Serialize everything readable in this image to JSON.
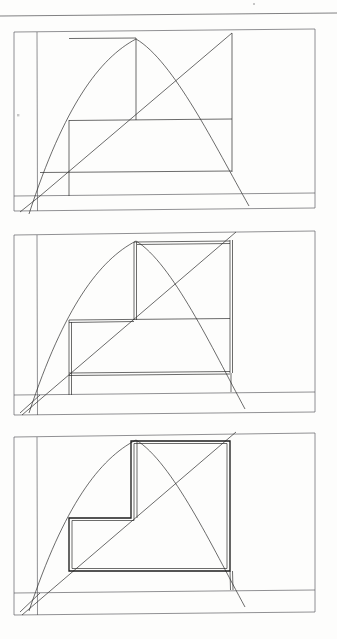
{
  "document": {
    "kind": "scanned-hand-drawn-figure",
    "title": "",
    "page_width": 337,
    "page_height": 639,
    "background_color": "#fdfdfc",
    "ink_color": "#2c2c2c",
    "bold_ink_color": "#1d1d1d",
    "soft_ink_color": "#55555a"
  },
  "header_rule": {
    "name": "top-horizontal-rule",
    "x1": 0,
    "y1": 16,
    "x2": 337,
    "y2": 13
  },
  "marks": [
    {
      "name": "tick-dot-left",
      "x": 17,
      "y": 114,
      "w": 2.4,
      "h": 2.4
    },
    {
      "name": "speck-top-right",
      "x": 253,
      "y": 3,
      "w": 2,
      "h": 2
    }
  ],
  "panels": [
    {
      "name": "panel-1",
      "index": 1,
      "emphasis": "none",
      "frame": {
        "x1": 14,
        "y1": 32,
        "x2": 315,
        "y2": 211,
        "top_right_y": 29,
        "bottom_right_y": 208
      },
      "baseline": {
        "x1": 14,
        "y1": 196,
        "x2": 315,
        "y2": 193
      },
      "axis_left": {
        "x": 37,
        "y1": 32,
        "x2": 37,
        "y2": 211
      },
      "origin": {
        "x": 40,
        "y": 196
      },
      "diagonal": {
        "x1": 40,
        "y1": 196,
        "x2": 232,
        "y2": 33
      },
      "parabola": {
        "x_left": 29,
        "y_left": 214,
        "apex_x": 136,
        "apex_y": 39,
        "x_right": 249,
        "y_right": 206
      },
      "steps": [
        {
          "name": "step-1-outer",
          "x_left": 40,
          "x_right": 232,
          "y_top": 172,
          "y_base": 196
        },
        {
          "name": "step-2-mid",
          "x_left": 69,
          "x_right": 232,
          "y_top": 120,
          "y_base": 172
        },
        {
          "name": "step-3-inner",
          "x_left": 69,
          "x_right": 136,
          "y_top": 38,
          "y_base": 120
        }
      ],
      "risers": [
        {
          "name": "riser-right-tall",
          "x": 232,
          "y1": 33,
          "y2": 172
        },
        {
          "name": "riser-mid",
          "x": 69,
          "y1": 120,
          "y2": 196
        },
        {
          "name": "riser-apex",
          "x": 136,
          "y1": 38,
          "y2": 120
        }
      ]
    },
    {
      "name": "panel-2",
      "index": 2,
      "emphasis": "double-traced",
      "frame": {
        "x1": 14,
        "y1": 235,
        "x2": 315,
        "y2": 415,
        "top_right_y": 231,
        "bottom_right_y": 412
      },
      "baseline": {
        "x1": 14,
        "y1": 395,
        "x2": 315,
        "y2": 392
      },
      "axis_left": {
        "x": 37,
        "y1": 235,
        "x2": 37,
        "y2": 415
      },
      "origin": {
        "x": 40,
        "y": 395
      },
      "diagonal": {
        "x1": 22,
        "y1": 415,
        "x2": 236,
        "y2": 232
      },
      "parabola": {
        "x_left": 29,
        "y_left": 413,
        "apex_x": 136,
        "apex_y": 241,
        "x_right": 245,
        "y_right": 409
      },
      "steps": [
        {
          "name": "step-1-outer",
          "x_left": 69,
          "x_right": 230,
          "y_top": 373,
          "y_base": 395
        },
        {
          "name": "step-2-mid",
          "x_left": 69,
          "x_right": 134,
          "y_top": 320,
          "y_base": 373
        },
        {
          "name": "step-3-inner",
          "x_left": 134,
          "x_right": 230,
          "y_top": 242,
          "y_base": 320
        }
      ],
      "risers": [
        {
          "name": "riser-right-tall",
          "x": 230,
          "y1": 240,
          "y2": 373
        },
        {
          "name": "riser-left",
          "x": 69,
          "y1": 320,
          "y2": 395
        },
        {
          "name": "riser-apex",
          "x": 134,
          "y1": 242,
          "y2": 320
        }
      ]
    },
    {
      "name": "panel-3",
      "index": 3,
      "emphasis": "bold-staircase",
      "frame": {
        "x1": 14,
        "y1": 437,
        "x2": 315,
        "y2": 615,
        "top_right_y": 433,
        "bottom_right_y": 612
      },
      "baseline": {
        "x1": 14,
        "y1": 593,
        "x2": 315,
        "y2": 590
      },
      "axis_left": {
        "x": 37,
        "y1": 437,
        "x2": 37,
        "y2": 615
      },
      "origin": {
        "x": 40,
        "y": 593
      },
      "diagonal": {
        "x1": 22,
        "y1": 615,
        "x2": 236,
        "y2": 432
      },
      "parabola": {
        "x_left": 29,
        "y_left": 611,
        "apex_x": 136,
        "apex_y": 440,
        "x_right": 245,
        "y_right": 607
      },
      "steps": [
        {
          "name": "step-1-outer",
          "x_left": 69,
          "x_right": 230,
          "y_top": 571,
          "y_base": 593
        },
        {
          "name": "step-2-mid",
          "x_left": 69,
          "x_right": 131,
          "y_top": 518,
          "y_base": 571
        },
        {
          "name": "step-3-inner",
          "x_left": 131,
          "x_right": 230,
          "y_top": 441,
          "y_base": 518
        }
      ],
      "risers": [
        {
          "name": "riser-right-tall",
          "x": 230,
          "y1": 440,
          "y2": 571
        },
        {
          "name": "riser-left",
          "x": 69,
          "y1": 518,
          "y2": 593
        },
        {
          "name": "riser-apex",
          "x": 131,
          "y1": 441,
          "y2": 518
        }
      ]
    }
  ],
  "chart_data": {
    "type": "line",
    "title": "",
    "xlabel": "",
    "ylabel": "",
    "series": [
      {
        "name": "parabola",
        "shape": "downward-parabola",
        "through_origin": true
      },
      {
        "name": "diagonal",
        "shape": "line",
        "slope": 1,
        "through_origin": true
      },
      {
        "name": "staircase",
        "shape": "step-rectangles",
        "steps": 3
      }
    ],
    "panels": 3,
    "grid": false,
    "legend": "none"
  }
}
